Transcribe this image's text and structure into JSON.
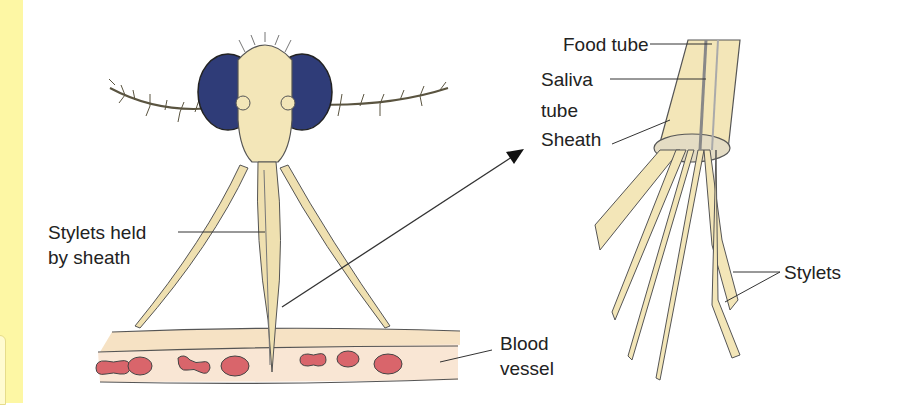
{
  "diagram": {
    "left_panel": {
      "labels": {
        "stylets_held_line1": "Stylets held",
        "stylets_held_line2": "by sheath",
        "blood_line1": "Blood",
        "blood_line2": "vessel"
      }
    },
    "right_panel": {
      "labels": {
        "food_tube": "Food tube",
        "saliva_line1": "Saliva",
        "saliva_line2": "tube",
        "sheath": "Sheath",
        "stylets": "Stylets"
      }
    },
    "colors": {
      "sidebar": "#fdf7a4",
      "eye": "#2f3c78",
      "body": "#f3e6b8",
      "blood_vessel": "#f6e2c4",
      "blood_cell": "#d9656b",
      "ink": "#333333"
    }
  }
}
